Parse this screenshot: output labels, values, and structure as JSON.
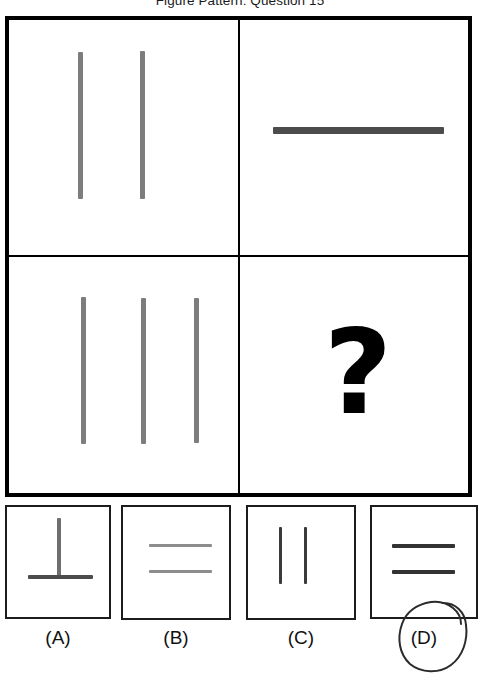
{
  "title": "Figure Pattern: Question 15",
  "colors": {
    "bar_gray": "#7d7d7d",
    "bar_dark": "#4c4c4c",
    "frame_black": "#000000",
    "option_border": "#1c1c1c",
    "annotation": "#2b2b2b"
  },
  "matrix": {
    "cells": [
      {
        "position": "top-left",
        "content": "two-vertical-bars",
        "orientation": "vertical",
        "count": 2
      },
      {
        "position": "top-right",
        "content": "one-horizontal-bar",
        "orientation": "horizontal",
        "count": 1
      },
      {
        "position": "bottom-left",
        "content": "three-vertical-bars",
        "orientation": "vertical",
        "count": 3
      },
      {
        "position": "bottom-right",
        "content": "question-mark",
        "glyph": "?"
      }
    ]
  },
  "options": [
    {
      "id": "a",
      "label": "(A)",
      "content": "vertical-line-over-horizontal-line",
      "selected": false
    },
    {
      "id": "b",
      "label": "(B)",
      "content": "two-horizontal-lines-light",
      "selected": false
    },
    {
      "id": "c",
      "label": "(C)",
      "content": "two-vertical-lines",
      "selected": false
    },
    {
      "id": "d",
      "label": "(D)",
      "content": "two-horizontal-lines-dark",
      "selected": true,
      "annotation": "hand-drawn-circle"
    }
  ]
}
